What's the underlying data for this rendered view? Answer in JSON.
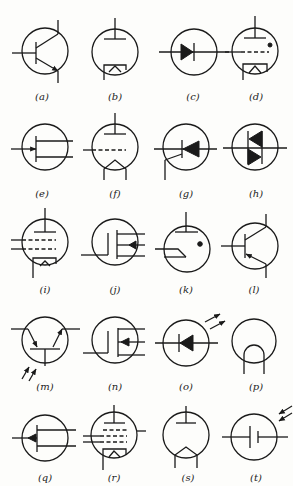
{
  "figure": {
    "background": "#fdfdfb",
    "ink": "#1a1a1a",
    "symbols": [
      {
        "id": "a",
        "label": "(a)",
        "type": "npn-transistor"
      },
      {
        "id": "b",
        "label": "(b)",
        "type": "diode-vacuum-tube"
      },
      {
        "id": "c",
        "label": "(c)",
        "type": "semiconductor-diode"
      },
      {
        "id": "d",
        "label": "(d)",
        "type": "gas-filled-triode-thyratron"
      },
      {
        "id": "e",
        "label": "(e)",
        "type": "n-channel-jfet"
      },
      {
        "id": "f",
        "label": "(f)",
        "type": "triode-vacuum-tube"
      },
      {
        "id": "g",
        "label": "(g)",
        "type": "silicon-controlled-rectifier"
      },
      {
        "id": "h",
        "label": "(h)",
        "type": "triac"
      },
      {
        "id": "i",
        "label": "(i)",
        "type": "pentode-vacuum-tube"
      },
      {
        "id": "j",
        "label": "(j)",
        "type": "n-channel-mosfet"
      },
      {
        "id": "k",
        "label": "(k)",
        "type": "gas-filled-tube"
      },
      {
        "id": "l",
        "label": "(l)",
        "type": "pnp-transistor"
      },
      {
        "id": "m",
        "label": "(m)",
        "type": "phototransistor"
      },
      {
        "id": "n",
        "label": "(n)",
        "type": "p-channel-mosfet"
      },
      {
        "id": "o",
        "label": "(o)",
        "type": "light-emitting-diode"
      },
      {
        "id": "p",
        "label": "(p)",
        "type": "incandescent-lamp"
      },
      {
        "id": "q",
        "label": "(q)",
        "type": "p-channel-jfet"
      },
      {
        "id": "r",
        "label": "(r)",
        "type": "pentode-vacuum-tube-multigrid"
      },
      {
        "id": "s",
        "label": "(s)",
        "type": "diode-tube-directly-heated"
      },
      {
        "id": "t",
        "label": "(t)",
        "type": "photovoltaic-cell"
      }
    ]
  }
}
